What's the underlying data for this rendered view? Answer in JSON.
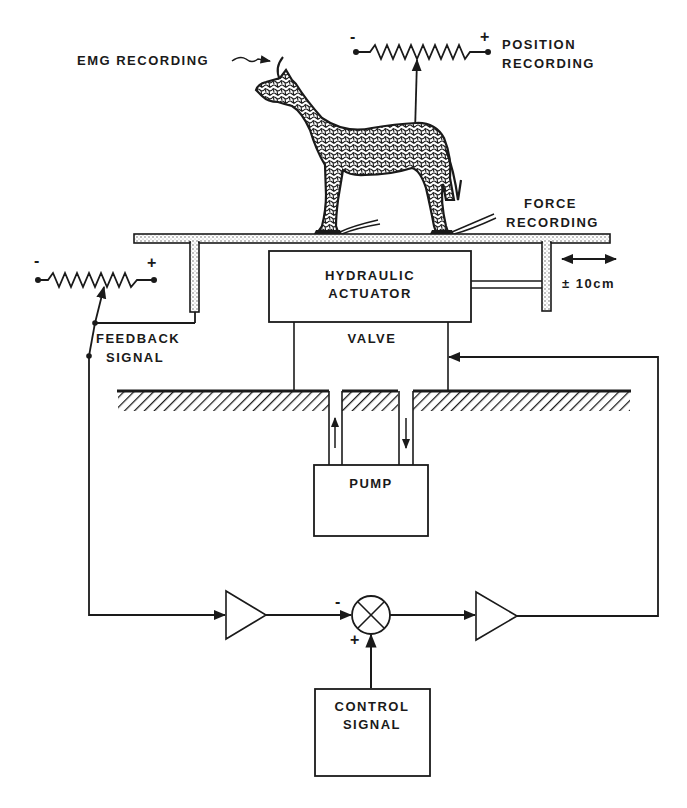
{
  "diagram": {
    "labels": {
      "emg_recording": "EMG RECORDING",
      "position_recording_line1": "POSITION",
      "position_recording_line2": "RECORDING",
      "force_recording_line1": "FORCE",
      "force_recording_line2": "RECORDING",
      "hydraulic_actuator_line1": "HYDRAULIC",
      "hydraulic_actuator_line2": "ACTUATOR",
      "displacement": "± 10cm",
      "valve": "VALVE",
      "pump": "PUMP",
      "feedback_signal_line1": "FEEDBACK",
      "feedback_signal_line2": "SIGNAL",
      "control_signal_line1": "CONTROL",
      "control_signal_line2": "SIGNAL"
    },
    "signs": {
      "position_pot_minus": "-",
      "position_pot_plus": "+",
      "feedback_pot_minus": "-",
      "feedback_pot_plus": "+",
      "summer_minus": "-",
      "summer_plus": "+"
    },
    "components": [
      "animal-on-platform",
      "position-potentiometer",
      "force-plates",
      "platform",
      "hydraulic-actuator",
      "valve",
      "pump",
      "feedback-potentiometer",
      "feedback-amplifier",
      "summing-junction",
      "drive-amplifier",
      "control-signal-generator"
    ],
    "colors": {
      "ink": "#1a1a1a",
      "background": "#ffffff"
    }
  }
}
